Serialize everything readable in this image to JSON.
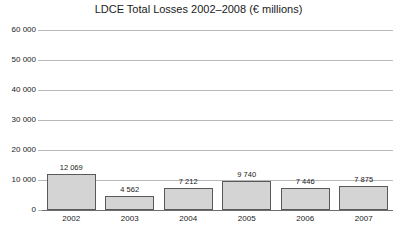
{
  "chart_data": {
    "type": "bar",
    "title": "LDCE Total Losses 2002–2008 (€ millions)",
    "xlabel": "",
    "ylabel": "",
    "categories": [
      "2002",
      "2003",
      "2004",
      "2005",
      "2006",
      "2007"
    ],
    "values": [
      12069,
      4562,
      7212,
      9740,
      7446,
      7875
    ],
    "value_labels": [
      "12 069",
      "4 562",
      "7 212",
      "9 740",
      "7 446",
      "7 875"
    ],
    "ylim": [
      0,
      60000
    ],
    "ytick_values": [
      0,
      10000,
      20000,
      30000,
      40000,
      50000,
      60000
    ],
    "ytick_labels": [
      "0",
      "10 000",
      "20 000",
      "30 000",
      "40 000",
      "50 000",
      "60 000"
    ],
    "grid": true,
    "legend": false,
    "series": [
      {
        "name": "LDCE Total Losses",
        "values": [
          12069,
          4562,
          7212,
          9740,
          7446,
          7875
        ]
      }
    ],
    "colors": {
      "bar_fill": "#d4d4d4",
      "bar_border": "#595959",
      "gridline": "#b8b8b8",
      "axis": "#6e6e6e",
      "text": "#1a1a1a",
      "background": "#ffffff"
    }
  }
}
